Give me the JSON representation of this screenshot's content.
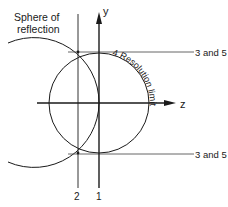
{
  "diagram": {
    "labels": {
      "sphere": [
        "Sphere of",
        "reflection"
      ],
      "y_axis": "y",
      "z_axis": "z",
      "resolution_limit": "4  Resolution limit",
      "line_top": "3 and 5",
      "line_bottom": "3 and 5",
      "vertical_1": "1",
      "vertical_2": "2"
    },
    "colors": {
      "ink": "#1a1a1a",
      "thin_line": "#555555",
      "background": "#ffffff"
    }
  }
}
